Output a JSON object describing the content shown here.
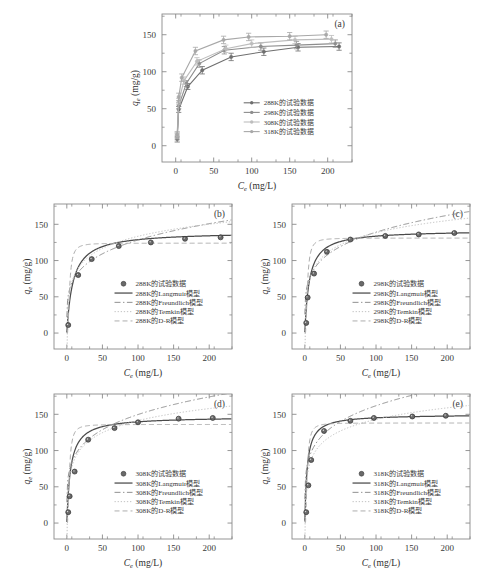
{
  "figure": {
    "background": "#ffffff",
    "axis_color": "#8a8a8a",
    "text_color": "#3a3a3a"
  },
  "axes": {
    "x_label_main": "C",
    "x_label_sub": "e",
    "x_label_unit": " (mg/L)",
    "y_label_main": "q",
    "y_label_sub": "e",
    "y_label_unit": " (mg/g)",
    "x_ticks": [
      0,
      50,
      100,
      150,
      200
    ],
    "y_ticks": [
      0,
      50,
      100,
      150
    ],
    "x_range": [
      -18,
      232
    ],
    "y_range": [
      -22,
      178
    ]
  },
  "panels": [
    {
      "id": "(a)",
      "name": "panel-a-all-temperatures",
      "legend": [
        {
          "label": "288K的试验数据",
          "color": "#6f6f6f",
          "style": "line-marker"
        },
        {
          "label": "298K的试验数据",
          "color": "#8d8d8d",
          "style": "line-marker"
        },
        {
          "label": "308K的试验数据",
          "color": "#bdbdbd",
          "style": "line-marker"
        },
        {
          "label": "318K的试验数据",
          "color": "#a8a8a8",
          "style": "line-marker"
        }
      ]
    },
    {
      "id": "(b)",
      "name": "panel-b-288K",
      "temperature": "288K",
      "legend": [
        {
          "label": "288K的试验数据",
          "color": "#555555",
          "style": "marker"
        },
        {
          "label": "288K的Langmuir模型",
          "color": "#4a4a4a",
          "style": "solid"
        },
        {
          "label": "288K的Freundlich模型",
          "color": "#909090",
          "style": "dashdot"
        },
        {
          "label": "288K的Temkin模型",
          "color": "#c2c2c2",
          "style": "dotted"
        },
        {
          "label": "288K的D-R模型",
          "color": "#adadad",
          "style": "dashed"
        }
      ]
    },
    {
      "id": "(c)",
      "name": "panel-c-298K",
      "temperature": "298K",
      "legend": [
        {
          "label": "298K的试验数据",
          "color": "#555555",
          "style": "marker"
        },
        {
          "label": "298K的Langmuir模型",
          "color": "#4a4a4a",
          "style": "solid"
        },
        {
          "label": "298K的Freundlich模型",
          "color": "#909090",
          "style": "dashdot"
        },
        {
          "label": "298K的Temkin模型",
          "color": "#c2c2c2",
          "style": "dotted"
        },
        {
          "label": "298K的D-R模型",
          "color": "#adadad",
          "style": "dashed"
        }
      ]
    },
    {
      "id": "(d)",
      "name": "panel-d-308K",
      "temperature": "308K",
      "legend": [
        {
          "label": "308K的试验数据",
          "color": "#555555",
          "style": "marker"
        },
        {
          "label": "308K的Langmuir模型",
          "color": "#4a4a4a",
          "style": "solid"
        },
        {
          "label": "308K的Freundlich模型",
          "color": "#909090",
          "style": "dashdot"
        },
        {
          "label": "308K的Temkin模型",
          "color": "#c2c2c2",
          "style": "dotted"
        },
        {
          "label": "308K的D-R模型",
          "color": "#adadad",
          "style": "dashed"
        }
      ]
    },
    {
      "id": "(e)",
      "name": "panel-e-318K",
      "temperature": "318K",
      "legend": [
        {
          "label": "318K的试验数据",
          "color": "#555555",
          "style": "marker"
        },
        {
          "label": "318K的Langmuir模型",
          "color": "#4a4a4a",
          "style": "solid"
        },
        {
          "label": "318K的Freundlich模型",
          "color": "#909090",
          "style": "dashdot"
        },
        {
          "label": "318K的Temkin模型",
          "color": "#c2c2c2",
          "style": "dotted"
        },
        {
          "label": "318K的D-R模型",
          "color": "#adadad",
          "style": "dashed"
        }
      ]
    }
  ],
  "chart_data": [
    {
      "type": "line",
      "panel": "(a)",
      "title": "",
      "xlabel": "Ce (mg/L)",
      "ylabel": "qe (mg/g)",
      "xlim": [
        -18,
        232
      ],
      "ylim": [
        -22,
        178
      ],
      "grid": false,
      "legend_position": "lower-right-inside",
      "errorbars": true,
      "series": [
        {
          "name": "288K的试验数据",
          "color": "#6f6f6f",
          "x": [
            2,
            4,
            16,
            35,
            73,
            116,
            161,
            215
          ],
          "y": [
            9,
            49,
            80,
            102,
            120,
            127,
            133,
            134
          ],
          "yerr": [
            4,
            4,
            4,
            5,
            5,
            5,
            5,
            5
          ]
        },
        {
          "name": "298K的试验数据",
          "color": "#8d8d8d",
          "x": [
            2,
            4,
            14,
            31,
            64,
            112,
            159,
            210
          ],
          "y": [
            12,
            54,
            84,
            111,
            129,
            134,
            136,
            138
          ],
          "yerr": [
            4,
            4,
            4,
            5,
            5,
            5,
            5,
            5
          ]
        },
        {
          "name": "308K的试验数据",
          "color": "#bdbdbd",
          "x": [
            2,
            4,
            11,
            28,
            66,
            100,
            157,
            205
          ],
          "y": [
            14,
            60,
            88,
            114,
            131,
            138,
            143,
            144
          ],
          "yerr": [
            4,
            4,
            5,
            5,
            5,
            5,
            5,
            5
          ]
        },
        {
          "name": "318K的试验数据",
          "color": "#a8a8a8",
          "x": [
            2,
            4,
            8,
            26,
            63,
            96,
            150,
            198
          ],
          "y": [
            15,
            66,
            92,
            128,
            143,
            147,
            148,
            150
          ],
          "yerr": [
            4,
            5,
            5,
            5,
            5,
            5,
            5,
            5
          ]
        }
      ]
    },
    {
      "type": "line",
      "panel": "(b)",
      "xlabel": "Ce (mg/L)",
      "ylabel": "qe (mg/g)",
      "xlim": [
        -18,
        232
      ],
      "ylim": [
        -22,
        178
      ],
      "grid": false,
      "legend_position": "lower-right-inside",
      "points": {
        "name": "288K的试验数据",
        "x": [
          2,
          16,
          35,
          73,
          118,
          166,
          216
        ],
        "y": [
          11,
          80,
          102,
          120,
          125,
          130,
          132
        ]
      },
      "models": [
        {
          "name": "288K的Langmuir模型",
          "style": "solid",
          "color": "#4a4a4a",
          "qmax": 140,
          "KL": 0.115
        },
        {
          "name": "288K的Freundlich模型",
          "style": "dashdot",
          "color": "#909090",
          "KF": 44,
          "n": 4.3
        },
        {
          "name": "288K的Temkin模型",
          "style": "dotted",
          "color": "#c2c2c2",
          "A": 2.6,
          "B": 24
        },
        {
          "name": "288K的D-R模型",
          "style": "dashed",
          "color": "#adadad",
          "qm": 124,
          "beta": 0.0022
        }
      ]
    },
    {
      "type": "line",
      "panel": "(c)",
      "xlabel": "Ce (mg/L)",
      "ylabel": "qe (mg/g)",
      "xlim": [
        -18,
        232
      ],
      "ylim": [
        -22,
        178
      ],
      "grid": false,
      "legend_position": "lower-right-inside",
      "points": {
        "name": "298K的试验数据",
        "x": [
          2,
          4,
          13,
          31,
          64,
          113,
          160,
          210
        ],
        "y": [
          14,
          49,
          82,
          112,
          129,
          134,
          136,
          138
        ]
      },
      "models": [
        {
          "name": "298K的Langmuir模型",
          "style": "solid",
          "color": "#4a4a4a",
          "qmax": 142,
          "KL": 0.16
        },
        {
          "name": "298K的Freundlich模型",
          "style": "dashdot",
          "color": "#909090",
          "KF": 50,
          "n": 4.5
        },
        {
          "name": "298K的Temkin模型",
          "style": "dotted",
          "color": "#c2c2c2",
          "A": 3.2,
          "B": 24
        },
        {
          "name": "298K的D-R模型",
          "style": "dashed",
          "color": "#adadad",
          "qm": 131,
          "beta": 0.002
        }
      ]
    },
    {
      "type": "line",
      "panel": "(d)",
      "xlabel": "Ce (mg/L)",
      "ylabel": "qe (mg/g)",
      "xlim": [
        -18,
        232
      ],
      "ylim": [
        -22,
        178
      ],
      "grid": false,
      "legend_position": "lower-right-inside",
      "points": {
        "name": "308K的试验数据",
        "x": [
          2,
          4,
          11,
          30,
          67,
          100,
          157,
          205
        ],
        "y": [
          15,
          37,
          71,
          115,
          131,
          139,
          144,
          145
        ]
      },
      "models": [
        {
          "name": "308K的Langmuir模型",
          "style": "solid",
          "color": "#4a4a4a",
          "qmax": 147,
          "KL": 0.19
        },
        {
          "name": "308K的Freundlich模型",
          "style": "dashdot",
          "color": "#909090",
          "KF": 55,
          "n": 4.6
        },
        {
          "name": "308K的Temkin模型",
          "style": "dotted",
          "color": "#c2c2c2",
          "A": 3.6,
          "B": 24
        },
        {
          "name": "308K的D-R模型",
          "style": "dashed",
          "color": "#adadad",
          "qm": 136,
          "beta": 0.0019
        }
      ]
    },
    {
      "type": "line",
      "panel": "(e)",
      "xlabel": "Ce (mg/L)",
      "ylabel": "qe (mg/g)",
      "xlim": [
        -18,
        232
      ],
      "ylim": [
        -22,
        178
      ],
      "grid": false,
      "legend_position": "lower-right-inside",
      "points": {
        "name": "318K的试验数据",
        "x": [
          2,
          5,
          9,
          27,
          64,
          97,
          151,
          198
        ],
        "y": [
          15,
          52,
          87,
          127,
          141,
          145,
          147,
          148
        ]
      },
      "models": [
        {
          "name": "318K的Langmuir模型",
          "style": "solid",
          "color": "#4a4a4a",
          "qmax": 150,
          "KL": 0.3
        },
        {
          "name": "318K的Freundlich模型",
          "style": "dashdot",
          "color": "#909090",
          "KF": 62,
          "n": 4.8
        },
        {
          "name": "318K的Temkin模型",
          "style": "dotted",
          "color": "#c2c2c2",
          "A": 5.0,
          "B": 23
        },
        {
          "name": "318K的D-R模型",
          "style": "dashed",
          "color": "#adadad",
          "qm": 138,
          "beta": 0.0017
        }
      ]
    }
  ]
}
